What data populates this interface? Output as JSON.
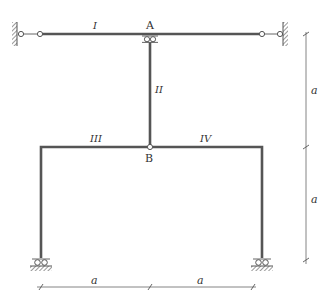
{
  "diagram": {
    "nodes": {
      "A": {
        "label": "A"
      },
      "B": {
        "label": "B"
      }
    },
    "members": [
      {
        "id": "I",
        "label": "I"
      },
      {
        "id": "II",
        "label": "II"
      },
      {
        "id": "III",
        "label": "III"
      },
      {
        "id": "IV",
        "label": "IV"
      }
    ],
    "dimensions": {
      "horizontal": [
        "a",
        "a"
      ],
      "vertical": [
        "a",
        "a"
      ]
    },
    "colors": {
      "member": "#555555",
      "line": "#666666"
    }
  }
}
